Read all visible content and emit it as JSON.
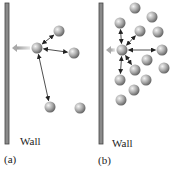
{
  "figure": {
    "panels": [
      {
        "id": "a",
        "caption": "(a)",
        "wall_label": "Wall",
        "wall": {
          "x": 5,
          "y": 3,
          "width": 4,
          "height": 141
        },
        "push_arrow": {
          "from": [
            30,
            48
          ],
          "to": [
            12,
            48
          ]
        },
        "center_sphere": [
          37,
          48
        ],
        "spheres": [
          [
            59,
            31
          ],
          [
            74,
            53
          ],
          [
            50,
            107
          ],
          [
            80,
            108
          ]
        ],
        "interaction_arrows_to": [
          0,
          1,
          2
        ]
      },
      {
        "id": "b",
        "caption": "(b)",
        "wall_label": "Wall",
        "wall": {
          "x": 99,
          "y": 3,
          "width": 4,
          "height": 141
        },
        "push_arrow": {
          "from": [
            115,
            50
          ],
          "to": [
            106,
            50
          ]
        },
        "center_sphere": [
          122,
          50
        ],
        "spheres": [
          [
            135,
            8
          ],
          [
            152,
            17
          ],
          [
            120,
            23
          ],
          [
            140,
            31
          ],
          [
            158,
            32
          ],
          [
            162,
            50
          ],
          [
            147,
            60
          ],
          [
            135,
            70
          ],
          [
            164,
            68
          ],
          [
            146,
            80
          ],
          [
            120,
            80
          ],
          [
            134,
            90
          ],
          [
            121,
            100
          ]
        ],
        "interaction_arrows_to": [
          2,
          3,
          5,
          7,
          10
        ]
      }
    ],
    "colors": {
      "wall_fill": "#8a8a8a",
      "wall_stroke": "#444444",
      "sphere_light": "#f2f2f2",
      "sphere_dark": "#6e6e6e",
      "arrow": "#222222",
      "push_arrow": "#b5b5b5"
    }
  }
}
